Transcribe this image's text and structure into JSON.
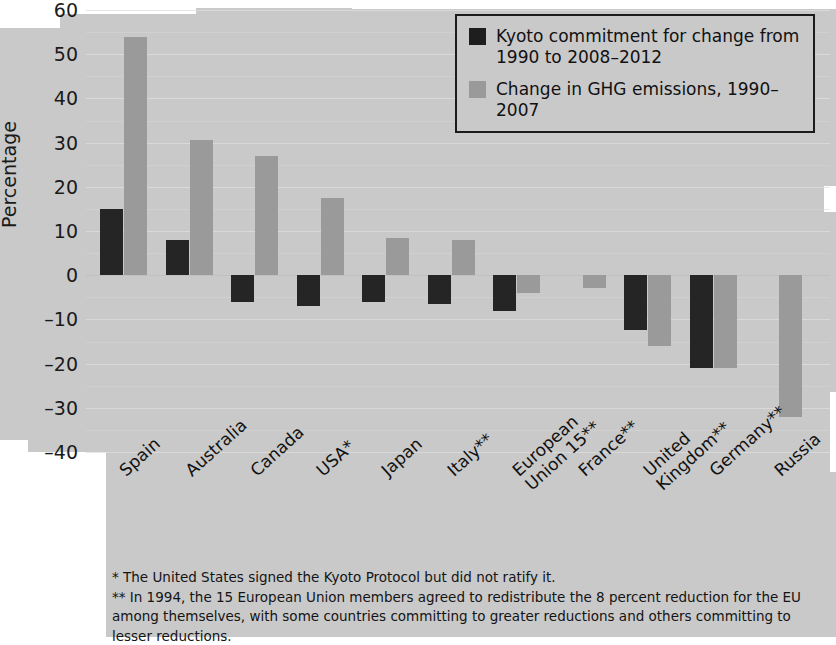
{
  "chart_data": {
    "type": "bar",
    "title": "",
    "xlabel": "",
    "ylabel": "Percentage",
    "ylim": [
      -40,
      60
    ],
    "yticks": [
      60,
      50,
      40,
      30,
      20,
      10,
      0,
      -10,
      -20,
      -30,
      -40
    ],
    "ytick_labels": [
      "60",
      "50",
      "40",
      "30",
      "20",
      "10",
      "0",
      "–10",
      "–20",
      "–30",
      "–40"
    ],
    "grid": true,
    "legend_position": "top-right",
    "categories": [
      "Spain",
      "Australia",
      "Canada",
      "USA*",
      "Japan",
      "Italy**",
      "European\nUnion 15**",
      "France**",
      "United\nKingdom**",
      "Germany**",
      "Russia"
    ],
    "series": [
      {
        "name": "Kyoto commitment for change from 1990 to 2008–2012",
        "color": "#252525",
        "values": [
          15,
          8,
          -6,
          -7,
          -6,
          -6.5,
          -8,
          0,
          -12.5,
          -21,
          0
        ]
      },
      {
        "name": "Change in GHG emissions, 1990–2007",
        "color": "#9a9a9a",
        "values": [
          54,
          30.5,
          27,
          17.5,
          8.5,
          8,
          -4,
          -3,
          -16,
          -21,
          -32
        ]
      }
    ]
  },
  "legend": {
    "items": [
      {
        "swatch": "kyoto",
        "label": "Kyoto commitment for change from\n1990 to 2008–2012"
      },
      {
        "swatch": "ghg",
        "label": "Change in GHG emissions, 1990–2007"
      }
    ]
  },
  "footnotes": [
    "* The United States signed the Kyoto Protocol but did not ratify it.",
    "** In 1994, the 15 European Union members agreed to redistribute the 8 percent reduction for the EU among themselves, with some countries committing to greater reductions and others committing to lesser reductions."
  ],
  "colors": {
    "page": "#c9c9c9",
    "kyoto": "#252525",
    "ghg": "#9a9a9a",
    "gridline": "#dedede",
    "text": "#111111"
  }
}
